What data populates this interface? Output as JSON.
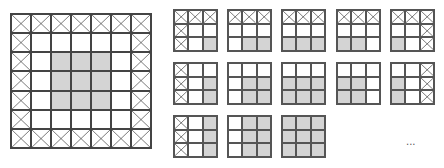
{
  "figure": {
    "big_grid": {
      "rows": 7,
      "cols": 7,
      "legend": {
        "X": "crossed-out border cell",
        "W": "white cell",
        "G": "gray cell"
      },
      "pattern": [
        "XXXXXXX",
        "XWWWWWX",
        "XWGGGWX",
        "XWGGGWX",
        "XWGGGWX",
        "XWWWWWX",
        "XXXXXXX"
      ]
    },
    "small_grids": [
      {
        "row": 0,
        "col": 0,
        "pattern": [
          "XXX",
          "XWW",
          "XWG"
        ]
      },
      {
        "row": 0,
        "col": 1,
        "pattern": [
          "XXX",
          "WWW",
          "WGG"
        ]
      },
      {
        "row": 0,
        "col": 2,
        "pattern": [
          "XXX",
          "WWW",
          "GGG"
        ]
      },
      {
        "row": 0,
        "col": 3,
        "pattern": [
          "XXX",
          "WWW",
          "GGW"
        ]
      },
      {
        "row": 0,
        "col": 4,
        "pattern": [
          "XXX",
          "WWX",
          "GWX"
        ]
      },
      {
        "row": 1,
        "col": 0,
        "pattern": [
          "XWW",
          "XWG",
          "XWG"
        ]
      },
      {
        "row": 1,
        "col": 1,
        "pattern": [
          "WWW",
          "WGG",
          "WGG"
        ]
      },
      {
        "row": 1,
        "col": 2,
        "pattern": [
          "WWW",
          "GGG",
          "GGG"
        ]
      },
      {
        "row": 1,
        "col": 3,
        "pattern": [
          "WWW",
          "GGW",
          "GGW"
        ]
      },
      {
        "row": 1,
        "col": 4,
        "pattern": [
          "WWX",
          "GWX",
          "GWX"
        ]
      },
      {
        "row": 2,
        "col": 0,
        "pattern": [
          "XWG",
          "XWG",
          "XWG"
        ]
      },
      {
        "row": 2,
        "col": 1,
        "pattern": [
          "WGG",
          "WGG",
          "WGG"
        ]
      },
      {
        "row": 2,
        "col": 2,
        "pattern": [
          "GGG",
          "GGG",
          "GGG"
        ]
      }
    ],
    "ellipsis": "...",
    "colors": {
      "gray": "#d4d4d4",
      "line": "#555555",
      "white": "#ffffff"
    }
  }
}
